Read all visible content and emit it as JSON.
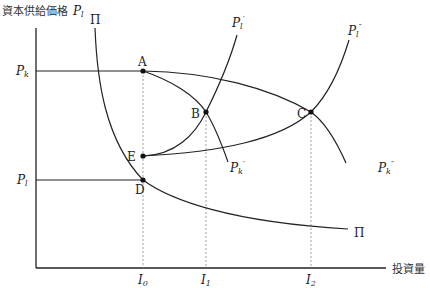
{
  "axes": {
    "y_label": "資本供給価格",
    "y_symbol": "P",
    "y_symbol_sub": "l",
    "x_label": "投資量"
  },
  "y_ticks": [
    {
      "symbol": "P",
      "sub": "k",
      "y": 71
    },
    {
      "symbol": "P",
      "sub": "l",
      "y": 180
    }
  ],
  "x_ticks": [
    {
      "symbol": "I",
      "sub": "0",
      "x": 143
    },
    {
      "symbol": "I",
      "sub": "1",
      "x": 206
    },
    {
      "symbol": "I",
      "sub": "2",
      "x": 311
    }
  ],
  "points": [
    {
      "name": "A",
      "x": 143,
      "y": 71
    },
    {
      "name": "B",
      "x": 206,
      "y": 112
    },
    {
      "name": "C",
      "x": 311,
      "y": 112
    },
    {
      "name": "D",
      "x": 143,
      "y": 180
    },
    {
      "name": "E",
      "x": 143,
      "y": 156
    }
  ],
  "curves": {
    "pi": {
      "label": "Π",
      "end_label": "Π"
    },
    "pl_prime": {
      "symbol": "P",
      "sub": "l",
      "prime": "′"
    },
    "pl_double_prime": {
      "symbol": "P",
      "sub": "l",
      "prime": "″"
    },
    "pk_prime": {
      "symbol": "P",
      "sub": "k",
      "prime": "′"
    },
    "pk_double_prime": {
      "symbol": "P",
      "sub": "k",
      "prime": "″"
    }
  }
}
